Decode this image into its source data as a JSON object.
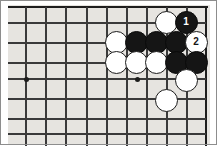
{
  "figure": {
    "kind": "go-board-diagram",
    "title": "",
    "board_background": "#e6e4e0",
    "line_color": "#3a3a3a",
    "edge_color": "#1d1d1d",
    "black_stone_color": "#151515",
    "white_stone_color": "#ffffff"
  },
  "grid": {
    "vertical_lines_x": [
      25,
      45,
      65,
      86,
      106,
      126,
      146,
      166,
      186
    ],
    "horizontal_lines_y": [
      22,
      42,
      62,
      78,
      98,
      118,
      133
    ],
    "top_edge_y": 7,
    "right_edge_x": 206,
    "star_points": [
      {
        "x": 25,
        "y": 78
      },
      {
        "x": 136,
        "y": 78
      }
    ]
  },
  "stones": [
    {
      "id": "w-a",
      "color": "white",
      "label": "",
      "x": 166,
      "y": 22
    },
    {
      "id": "b-1",
      "color": "black",
      "label": "1",
      "x": 186,
      "y": 22
    },
    {
      "id": "w-b",
      "color": "white",
      "label": "",
      "x": 116,
      "y": 42
    },
    {
      "id": "b-c",
      "color": "black",
      "label": "",
      "x": 136,
      "y": 42
    },
    {
      "id": "b-d",
      "color": "black",
      "label": "",
      "x": 156,
      "y": 42
    },
    {
      "id": "b-e",
      "color": "black",
      "label": "",
      "x": 176,
      "y": 42
    },
    {
      "id": "w-2",
      "color": "white",
      "label": "2",
      "x": 196,
      "y": 42
    },
    {
      "id": "w-f",
      "color": "white",
      "label": "",
      "x": 116,
      "y": 62
    },
    {
      "id": "w-g",
      "color": "white",
      "label": "",
      "x": 136,
      "y": 62
    },
    {
      "id": "w-h",
      "color": "white",
      "label": "",
      "x": 156,
      "y": 62
    },
    {
      "id": "b-i",
      "color": "black",
      "label": "",
      "x": 176,
      "y": 62
    },
    {
      "id": "b-j",
      "color": "black",
      "label": "",
      "x": 196,
      "y": 62
    },
    {
      "id": "w-k",
      "color": "white",
      "label": "",
      "x": 186,
      "y": 80
    },
    {
      "id": "w-l",
      "color": "white",
      "label": "",
      "x": 166,
      "y": 100
    }
  ],
  "move_labels": [
    {
      "number": "1",
      "color": "black"
    },
    {
      "number": "2",
      "color": "white"
    }
  ]
}
